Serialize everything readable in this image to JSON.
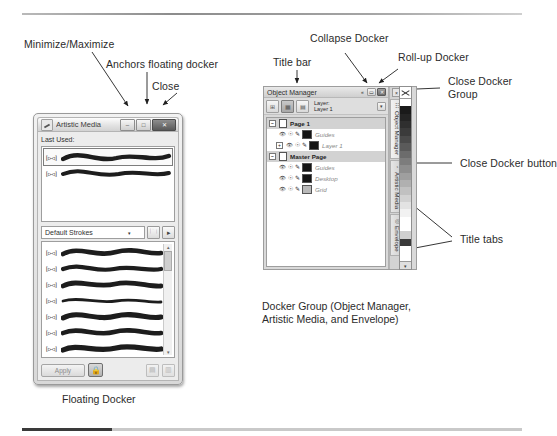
{
  "annotations": [
    {
      "id": "minimize-maximize",
      "text": "Minimize/Maximize"
    },
    {
      "id": "anchors-floating-docker",
      "text": "Anchors floating docker"
    },
    {
      "id": "close",
      "text": "Close"
    },
    {
      "id": "title-bar",
      "text": "Title bar"
    },
    {
      "id": "collapse-docker",
      "text": "Collapse Docker"
    },
    {
      "id": "roll-up-docker",
      "text": "Roll-up Docker"
    },
    {
      "id": "close-docker-group-l1",
      "text": "Close Docker"
    },
    {
      "id": "close-docker-group-l2",
      "text": "Group"
    },
    {
      "id": "close-docker-button",
      "text": "Close Docker button"
    },
    {
      "id": "title-tabs",
      "text": "Title tabs"
    }
  ],
  "captions": {
    "floating_docker": "Floating Docker",
    "docker_group_line1": "Docker Group (Object Manager,",
    "docker_group_line2": "Artistic Media, and Envelope)"
  },
  "floating_docker": {
    "title": "Artistic Media",
    "icon": "brush-icon",
    "buttons": [
      {
        "name": "minimize-maximize-button",
        "glyph": "–"
      },
      {
        "name": "anchor-button",
        "glyph": "□"
      },
      {
        "name": "close-button",
        "glyph": "✕"
      }
    ],
    "last_used_label": "Last Used:",
    "last_used_strokes": [
      {
        "nib": "[▷◁]",
        "selected": true
      },
      {
        "nib": "[▷◁]",
        "selected": false
      }
    ],
    "category": {
      "value": "Default Strokes",
      "placeholder": "Default Strokes",
      "arrow": "▾"
    },
    "category_buttons": [
      {
        "name": "browse-folder-button",
        "glyph": "🗀"
      },
      {
        "name": "save-stroke-button",
        "glyph": "▸"
      }
    ],
    "stroke_list": [
      {
        "nib": "[▷◁]"
      },
      {
        "nib": "[▷◁]"
      },
      {
        "nib": "[▷◁]"
      },
      {
        "nib": "[▷◁]"
      },
      {
        "nib": "[▷◁]"
      },
      {
        "nib": "[▷◁]"
      },
      {
        "nib": "[▷◁]"
      },
      {
        "nib": "[▷◁]"
      },
      {
        "nib": "[▷◁]"
      }
    ],
    "scroll_up": "▴",
    "scroll_down": "▾",
    "footer": {
      "apply_label": "Apply",
      "lock_glyph": "🔒",
      "save_glyph": "▤",
      "delete_glyph": "▥"
    }
  },
  "docker": {
    "title": "Object Manager",
    "titlebar_buttons": [
      {
        "name": "collapse-docker-button",
        "glyph": "«"
      },
      {
        "name": "roll-up-docker-button",
        "glyph": "▭"
      },
      {
        "name": "close-docker-group-button",
        "glyph": "✕"
      }
    ],
    "toolbar": [
      {
        "name": "new-layer-button",
        "glyph": "⊞",
        "active": false
      },
      {
        "name": "layer-manager-view-button",
        "glyph": "▦",
        "active": true
      },
      {
        "name": "new-master-layer-button",
        "glyph": "▤",
        "active": false
      }
    ],
    "layer_label": "Layer:\nLayer 1",
    "row_options_glyph": "▾",
    "tree": [
      {
        "type": "group",
        "expander": "−",
        "icon": "page-icon",
        "label": "Page 1",
        "italic": false
      },
      {
        "type": "leaf",
        "expander": "",
        "label": "Guides",
        "italic": true,
        "chip": "dark"
      },
      {
        "type": "leaf",
        "expander": "+",
        "label": "Layer 1",
        "italic": true,
        "chip": "dark"
      },
      {
        "type": "group",
        "expander": "−",
        "icon": "page-icon",
        "label": "Master Page",
        "italic": false
      },
      {
        "type": "leaf",
        "expander": "",
        "label": "Guides",
        "italic": true,
        "chip": "dark"
      },
      {
        "type": "leaf",
        "expander": "",
        "label": "Desktop",
        "italic": true,
        "chip": "dark"
      },
      {
        "type": "leaf",
        "expander": "",
        "label": "Grid",
        "italic": true,
        "chip": "gray"
      }
    ],
    "tabs": [
      {
        "name": "tab-object-manager",
        "label": "Object Manager",
        "icon": "☷",
        "active": true
      },
      {
        "name": "tab-artistic-media",
        "label": "Artistic Media",
        "icon": "◔",
        "active": false
      },
      {
        "name": "tab-envelope",
        "label": "Envelope",
        "icon": "◎",
        "active": false
      }
    ],
    "close_docker_button_glyph": "×",
    "tab_handle_glyph": "▪"
  },
  "palette": {
    "name": "color-palette-strip",
    "no_color_glyph": "✕",
    "swatches": [
      "#ffffff",
      "#1a1a1a",
      "#242424",
      "#2f2f2f",
      "#3b3b3b",
      "#4a4a4a",
      "#5a5a5a",
      "#6c6c6c",
      "#7d7d7d",
      "#8e8e8e",
      "#9f9f9f",
      "#b0b0b0",
      "#c1c1c1",
      "#d2d2d2",
      "#e3e3e3",
      "#f2f2f2",
      "#ffffff",
      "#ffffff",
      "#cfcfcf",
      "#3a3a3a",
      "#ffffff",
      "#ffffff"
    ],
    "scroll_glyph": "▾"
  },
  "colors": {
    "ink": "#2b2b2b",
    "rule": "#9a9a9a",
    "chrome": "#d9d9d9"
  }
}
